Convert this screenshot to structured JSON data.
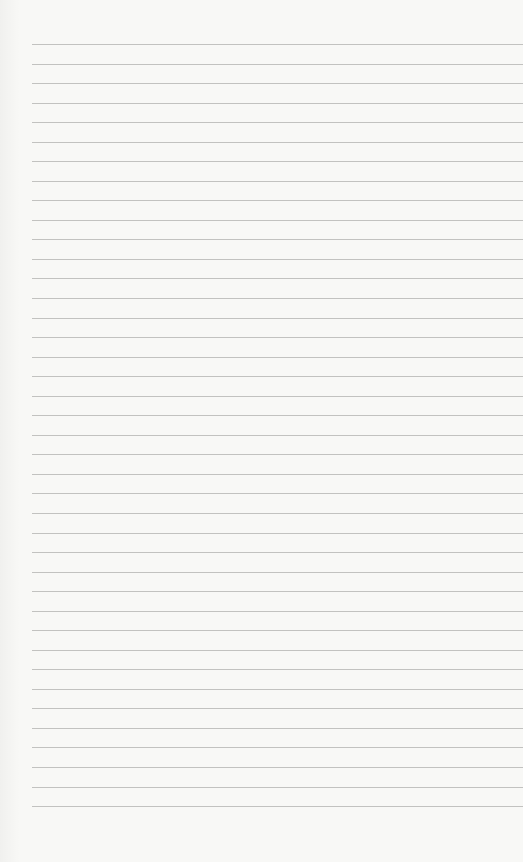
{
  "page": {
    "type": "lined-paper",
    "background_color": "#f8f8f6",
    "line_color": "#b9b9b6",
    "line_count": 40,
    "first_line_y": 44,
    "line_spacing": 19.54,
    "line_left_margin": 32
  }
}
